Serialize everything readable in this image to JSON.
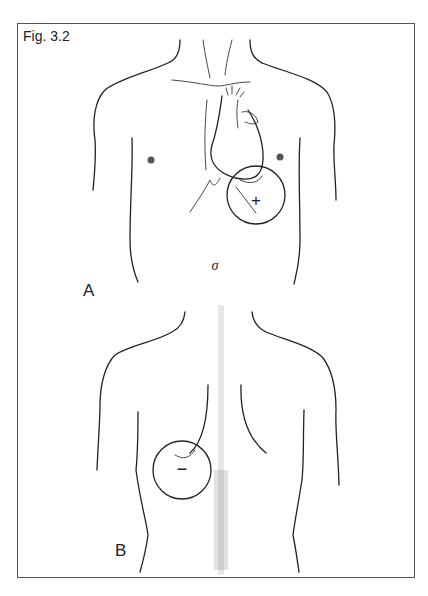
{
  "figure": {
    "label": "Fig. 3.2",
    "panels": [
      {
        "id": "A",
        "label": "A",
        "view": "anterior-torso",
        "marker": {
          "symbol": "+",
          "meaning": "positive"
        },
        "sex_symbol": "σ"
      },
      {
        "id": "B",
        "label": "B",
        "view": "posterior-torso",
        "marker": {
          "symbol": "−",
          "meaning": "negative"
        }
      }
    ]
  },
  "colors": {
    "line": "#222222",
    "frame": "#555555",
    "background": "#ffffff",
    "stipple": "#777777"
  }
}
